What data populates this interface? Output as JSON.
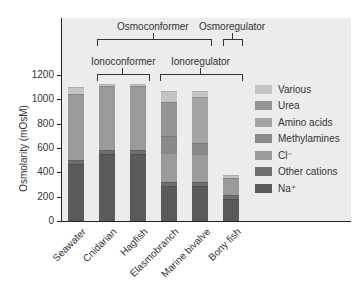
{
  "chart_data": {
    "type": "bar",
    "stacked": true,
    "title": "",
    "xlabel": "",
    "ylabel": "Osmolarity (mOsM)",
    "ylim": [
      0,
      1200
    ],
    "yticks": [
      0,
      200,
      400,
      600,
      800,
      1000,
      1200
    ],
    "categories": [
      "Seawater",
      "Cnidarian",
      "Hagfish",
      "Elasmobranch",
      "Marine bivalve",
      "Bony fish"
    ],
    "series": [
      {
        "name": "Na⁺",
        "color": "#5a5a5a",
        "values": [
          470,
          550,
          550,
          290,
          290,
          180
        ]
      },
      {
        "name": "Other cations",
        "color": "#6e6e6e",
        "values": [
          30,
          30,
          30,
          30,
          30,
          30
        ]
      },
      {
        "name": "Cl⁻",
        "color": "#9a9a9a",
        "values": [
          540,
          530,
          530,
          240,
          230,
          140
        ]
      },
      {
        "name": "Methylamines",
        "color": "#8a8a8a",
        "values": [
          0,
          0,
          0,
          140,
          90,
          0
        ]
      },
      {
        "name": "Amino acids",
        "color": "#a4a4a4",
        "values": [
          0,
          0,
          0,
          0,
          380,
          0
        ]
      },
      {
        "name": "Urea",
        "color": "#949494",
        "values": [
          0,
          0,
          0,
          280,
          0,
          0
        ]
      },
      {
        "name": "Various",
        "color": "#c4c4c4",
        "values": [
          60,
          20,
          20,
          90,
          50,
          30
        ]
      }
    ],
    "totals": [
      1100,
      1130,
      1130,
      1070,
      1070,
      380
    ],
    "legend_position": "right",
    "grid": false,
    "annotations": [
      {
        "label": "Osmoconformer",
        "spans": [
          "Cnidarian",
          "Hagfish",
          "Elasmobranch",
          "Marine bivalve"
        ]
      },
      {
        "label": "Osmoregulator",
        "spans": [
          "Bony fish"
        ]
      },
      {
        "label": "Ionoconformer",
        "spans": [
          "Cnidarian",
          "Hagfish"
        ]
      },
      {
        "label": "Ionoregulator",
        "spans": [
          "Elasmobranch",
          "Marine bivalve",
          "Bony fish"
        ]
      }
    ]
  },
  "axis": {
    "y_title": "Osmolarity (mOsM)",
    "y_ticks": [
      "0",
      "200",
      "400",
      "600",
      "800",
      "1000",
      "1200"
    ]
  },
  "legend": [
    {
      "label": "Various",
      "color": "#c4c4c4"
    },
    {
      "label": "Urea",
      "color": "#949494"
    },
    {
      "label": "Amino acids",
      "color": "#a4a4a4"
    },
    {
      "label": "Methylamines",
      "color": "#8a8a8a"
    },
    {
      "label": "Cl⁻",
      "color": "#9a9a9a"
    },
    {
      "label": "Other cations",
      "color": "#6e6e6e"
    },
    {
      "label": "Na⁺",
      "color": "#5a5a5a"
    }
  ],
  "brackets": {
    "osmoconformer": "Osmoconformer",
    "osmoregulator": "Osmoregulator",
    "ionoconformer": "Ionoconformer",
    "ionoregulator": "Ionoregulator"
  }
}
